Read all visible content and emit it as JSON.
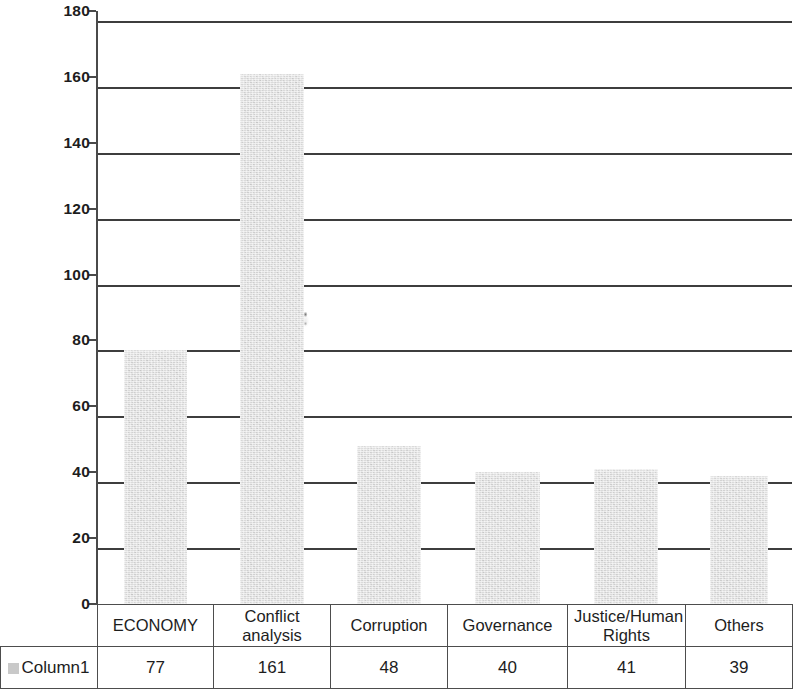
{
  "chart_data": {
    "type": "bar",
    "title": "",
    "subtitle": "",
    "xlabel": "",
    "ylabel": "",
    "categories": [
      "ECONOMY",
      "Conflict analysis",
      "Corruption",
      "Governance",
      "Justice/Human Rights",
      "Others"
    ],
    "series": [
      {
        "name": "Column1",
        "values": [
          77,
          161,
          48,
          40,
          41,
          39
        ]
      }
    ],
    "values": [
      77,
      161,
      48,
      40,
      41,
      39
    ],
    "ylim": [
      0,
      180
    ],
    "ytick_step": 20,
    "ytick_labels": [
      "180",
      "160",
      "140",
      "120",
      "100",
      "80",
      "60",
      "40",
      "20",
      "0"
    ],
    "ytick_values": [
      180,
      160,
      140,
      120,
      100,
      80,
      60,
      40,
      20,
      0
    ],
    "grid": "horizontal",
    "legend_position": "table-row-header",
    "has_data_table": true,
    "bar_color": "#dadada",
    "gridline_color": "#3d3d3d",
    "axis_color": "#4a4a4a",
    "text_color": "#1d1d1d"
  },
  "legend": {
    "series_label": "Column1",
    "swatch_color": "#c9c9c9"
  },
  "table": {
    "category_row": [
      "ECONOMY",
      "Conflict analysis",
      "Corruption",
      "Governance",
      "Justice/Human Rights",
      "Others"
    ],
    "value_row": [
      "77",
      "161",
      "48",
      "40",
      "41",
      "39"
    ],
    "row_header": "Column1"
  }
}
